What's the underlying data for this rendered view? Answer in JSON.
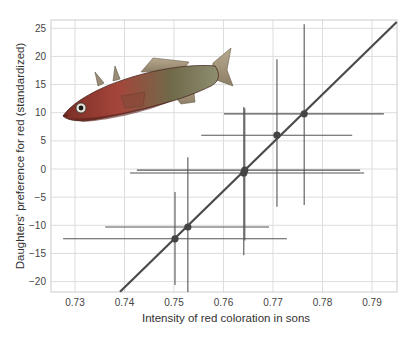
{
  "chart_data": {
    "type": "scatter",
    "title": "",
    "xlabel": "Intensity of red coloration in sons",
    "ylabel": "Daughters' preference for red (standardized)",
    "xlim": [
      0.725,
      0.795
    ],
    "ylim": [
      -22.5,
      26.5
    ],
    "xticks": [
      0.73,
      0.74,
      0.75,
      0.76,
      0.77,
      0.78,
      0.79
    ],
    "xtick_labels": [
      "0.73",
      "0.74",
      "0.75",
      "0.76",
      "0.77",
      "0.78",
      "0.79"
    ],
    "yticks": [
      25,
      20,
      15,
      10,
      5,
      0,
      -5,
      -10,
      -15,
      -20
    ],
    "ytick_labels": [
      "25",
      "20",
      "15",
      "10",
      "5",
      "0",
      "−5",
      "−10",
      "−15",
      "−20"
    ],
    "grid": true,
    "legend": null,
    "points": [
      {
        "x": 0.7502,
        "y": -12.4,
        "x_lo": 0.7276,
        "x_hi": 0.7728,
        "y_lo": -20.6,
        "y_hi": -4.1
      },
      {
        "x": 0.7528,
        "y": -10.3,
        "x_lo": 0.7361,
        "x_hi": 0.7692,
        "y_lo": -22.4,
        "y_hi": 2.1
      },
      {
        "x": 0.7641,
        "y": -0.7,
        "x_lo": 0.7411,
        "x_hi": 0.7884,
        "y_lo": -15.3,
        "y_hi": 11.0
      },
      {
        "x": 0.7643,
        "y": -0.2,
        "x_lo": 0.7425,
        "x_hi": 0.7876,
        "y_lo": -12.7,
        "y_hi": 10.8
      },
      {
        "x": 0.7708,
        "y": 6.0,
        "x_lo": 0.7555,
        "x_hi": 0.786,
        "y_lo": -6.7,
        "y_hi": 19.5
      },
      {
        "x": 0.7763,
        "y": 9.8,
        "x_lo": 0.7601,
        "x_hi": 0.7924,
        "y_lo": -6.4,
        "y_hi": 25.7
      }
    ],
    "regression_line": {
      "x1": 0.7391,
      "y1": -21.8,
      "x2": 0.795,
      "y2": 26.1
    },
    "annotations": [
      "illustration of a stickleback fish (upper left)"
    ]
  },
  "colors": {
    "grid": "#dddddd",
    "frame": "#cccccc",
    "data": "#555555",
    "regression": "#4a4a4a"
  }
}
